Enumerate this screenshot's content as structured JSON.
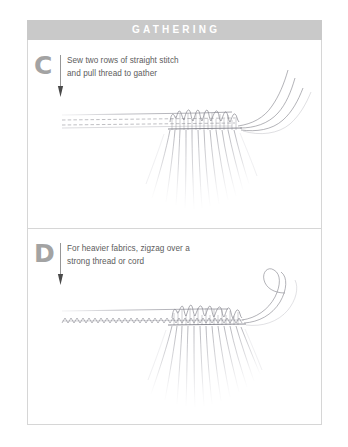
{
  "header": {
    "title": "GATHERING"
  },
  "panels": [
    {
      "marker": "C",
      "instruction_line1": "Sew two rows of straight stitch",
      "instruction_line2": "and pull thread to gather",
      "illustration_name": "gathered-fabric-straight-stitch-diagram"
    },
    {
      "marker": "D",
      "instruction_line1": "For heavier fabrics, zigzag over a",
      "instruction_line2": "strong thread or cord",
      "illustration_name": "gathered-fabric-zigzag-over-cord-diagram"
    }
  ],
  "colors": {
    "header_bar": "#c9c9c9",
    "header_text": "#ffffff",
    "marker": "#a3a3a3",
    "body_text": "#5c5c5c",
    "frame_border": "#d6d6d6",
    "line_art": "#8a8a92",
    "background": "#ffffff"
  }
}
